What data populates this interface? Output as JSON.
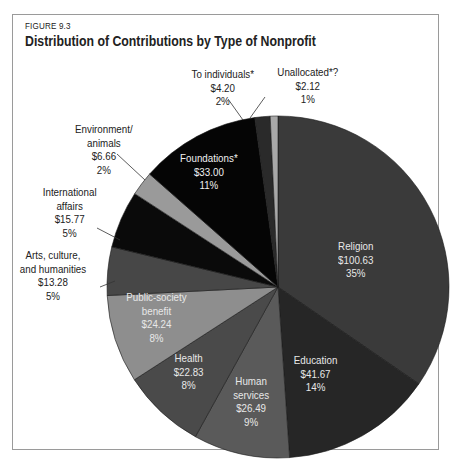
{
  "figure_label": "FIGURE 9.3",
  "title": "Distribution of Contributions by Type of Nonprofit",
  "chart_data": {
    "type": "pie",
    "title": "Distribution of Contributions by Type of Nonprofit",
    "subtitle": "FIGURE 9.3",
    "unit": "$ billions",
    "start_angle_deg": 0,
    "direction": "clockwise",
    "slices": [
      {
        "label": "Religion",
        "value": 100.63,
        "value_label": "$100.63",
        "percent": 35,
        "percent_label": "35%",
        "color": "#3a3a3a"
      },
      {
        "label": "Education",
        "value": 41.67,
        "value_label": "$41.67",
        "percent": 14,
        "percent_label": "14%",
        "color": "#262626"
      },
      {
        "label": "Human services",
        "value": 26.49,
        "value_label": "$26.49",
        "percent": 9,
        "percent_label": "9%",
        "color": "#5a5a5a"
      },
      {
        "label": "Health",
        "value": 22.83,
        "value_label": "$22.83",
        "percent": 8,
        "percent_label": "8%",
        "color": "#4a4a4a"
      },
      {
        "label": "Public-society benefit",
        "value": 24.24,
        "value_label": "$24.24",
        "percent": 8,
        "percent_label": "8%",
        "color": "#8e8e8e"
      },
      {
        "label": "Arts, culture, and humanities",
        "value": 13.28,
        "value_label": "$13.28",
        "percent": 5,
        "percent_label": "5%",
        "color": "#474747"
      },
      {
        "label": "International affairs",
        "value": 15.77,
        "value_label": "$15.77",
        "percent": 5,
        "percent_label": "5%",
        "color": "#0a0a0a"
      },
      {
        "label": "Environment/ animals",
        "value": 6.66,
        "value_label": "$6.66",
        "percent": 2,
        "percent_label": "2%",
        "color": "#9a9a9a"
      },
      {
        "label": "Foundations*",
        "value": 33.0,
        "value_label": "$33.00",
        "percent": 11,
        "percent_label": "11%",
        "color": "#050505"
      },
      {
        "label": "To individuals*",
        "value": 4.2,
        "value_label": "$4.20",
        "percent": 2,
        "percent_label": "2%",
        "color": "#2a2a2a"
      },
      {
        "label": "Unallocated*?",
        "value": 2.12,
        "value_label": "$2.12",
        "percent": 1,
        "percent_label": "1%",
        "color": "#a8a8a8"
      }
    ]
  },
  "labels": {
    "religion": [
      "Religion",
      "$100.63",
      "35%"
    ],
    "education": [
      "Education",
      "$41.67",
      "14%"
    ],
    "human": [
      "Human",
      "services",
      "$26.49",
      "9%"
    ],
    "health": [
      "Health",
      "$22.83",
      "8%"
    ],
    "public": [
      "Public-society",
      "benefit",
      "$24.24",
      "8%"
    ],
    "arts": [
      "Arts, culture,",
      "and humanities",
      "$13.28",
      "5%"
    ],
    "intl": [
      "International",
      "affairs",
      "$15.77",
      "5%"
    ],
    "env": [
      "Environment/",
      "animals",
      "$6.66",
      "2%"
    ],
    "found": [
      "Foundations*",
      "$33.00",
      "11%"
    ],
    "indiv": [
      "To individuals*",
      "$4.20",
      "2%"
    ],
    "unalloc": [
      "Unallocated*?",
      "$2.12",
      "1%"
    ]
  }
}
